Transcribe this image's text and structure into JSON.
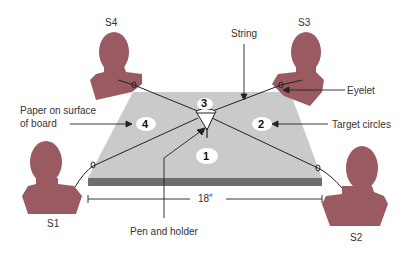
{
  "diagram": {
    "people": [
      {
        "id": "S1",
        "label": "S1"
      },
      {
        "id": "S2",
        "label": "S2"
      },
      {
        "id": "S3",
        "label": "S3"
      },
      {
        "id": "S4",
        "label": "S4"
      }
    ],
    "targets": [
      {
        "id": "1",
        "label": "1"
      },
      {
        "id": "2",
        "label": "2"
      },
      {
        "id": "3",
        "label": "3"
      },
      {
        "id": "4",
        "label": "4"
      }
    ],
    "callouts": {
      "string": "String",
      "eyelet": "Eyelet",
      "paper_line1": "Paper on surface",
      "paper_line2": "of board",
      "target_circles": "Target circles",
      "pen_holder": "Pen and holder"
    },
    "dimension": "18″"
  },
  "colors": {
    "person": "#9a5a62",
    "board": "#c9caca",
    "board_edge": "#6e6e6e",
    "line": "#222222",
    "text": "#333333"
  }
}
